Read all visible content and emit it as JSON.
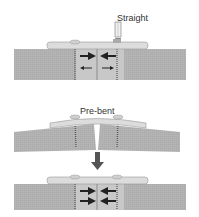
{
  "panels": [
    {
      "id": "straight",
      "label": "Straight",
      "arrows": "compression-top, distraction-bottom"
    },
    {
      "id": "pre-bent",
      "label": "Pre-bent"
    },
    {
      "id": "result",
      "label": "",
      "arrows": "compression-both"
    }
  ],
  "footer_text": "",
  "colors": {
    "bone": "#b4b4b4",
    "plate": "#dcdcdc",
    "arrow": "#222222",
    "transition_arrow": "#555555"
  }
}
